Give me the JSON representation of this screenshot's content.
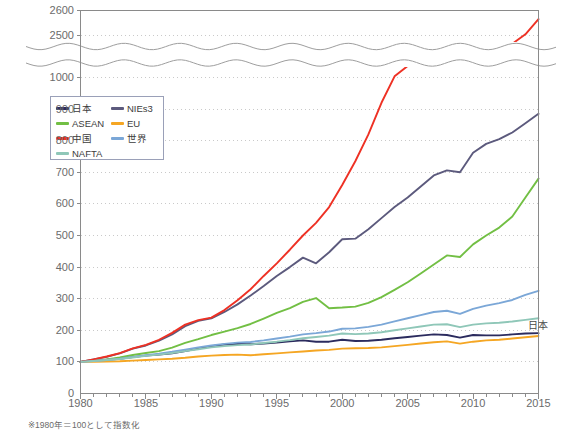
{
  "chart_data": {
    "type": "line",
    "title": "",
    "xlabel": "",
    "ylabel": "",
    "note": "※1980年＝100として指数化",
    "grid": true,
    "legend_position": "upper-left-inside",
    "axis_break": {
      "present": true,
      "below": 1100,
      "above": 2450,
      "style": "wavy"
    },
    "xlim": [
      1980,
      2015
    ],
    "xticks": [
      1980,
      1985,
      1990,
      1995,
      2000,
      2005,
      2010,
      2015
    ],
    "xtick_labels": [
      "1980",
      "1985",
      "1990",
      "1995",
      "2000",
      "2005",
      "2010",
      "2015"
    ],
    "x_minor_tick_interval": 1,
    "ylim": [
      0,
      2600
    ],
    "yticks": [
      0,
      100,
      200,
      300,
      400,
      500,
      600,
      700,
      800,
      900,
      1000,
      2500,
      2600
    ],
    "ytick_labels": [
      "0",
      "100",
      "200",
      "300",
      "400",
      "500",
      "600",
      "700",
      "800",
      "900",
      "1000",
      "2500",
      "2600"
    ],
    "x": [
      1980,
      1981,
      1982,
      1983,
      1984,
      1985,
      1986,
      1987,
      1988,
      1989,
      1990,
      1991,
      1992,
      1993,
      1994,
      1995,
      1996,
      1997,
      1998,
      1999,
      2000,
      2001,
      2002,
      2003,
      2004,
      2005,
      2006,
      2007,
      2008,
      2009,
      2010,
      2011,
      2012,
      2013,
      2014,
      2015
    ],
    "annotations": [
      {
        "text": "日本",
        "x": 2014.2,
        "y": 193
      }
    ],
    "series": [
      {
        "name": "日本",
        "color": "#2b2b5e",
        "values": [
          100,
          104,
          107,
          110,
          115,
          120,
          123,
          127,
          134,
          142,
          150,
          155,
          157,
          156,
          158,
          161,
          165,
          168,
          164,
          164,
          170,
          166,
          167,
          170,
          175,
          179,
          183,
          187,
          185,
          177,
          185,
          184,
          184,
          187,
          190,
          191
        ]
      },
      {
        "name": "NIEs3",
        "color": "#5c5a7d",
        "values": [
          100,
          108,
          116,
          127,
          142,
          152,
          167,
          187,
          213,
          230,
          238,
          258,
          282,
          310,
          340,
          372,
          400,
          430,
          412,
          447,
          488,
          490,
          520,
          555,
          590,
          620,
          655,
          690,
          706,
          700,
          762,
          790,
          805,
          826,
          855,
          885
        ]
      },
      {
        "name": "ASEAN",
        "color": "#72bf44",
        "values": [
          100,
          104,
          108,
          114,
          122,
          128,
          134,
          145,
          160,
          172,
          185,
          196,
          207,
          220,
          237,
          255,
          270,
          290,
          302,
          270,
          272,
          275,
          287,
          305,
          328,
          352,
          380,
          408,
          437,
          432,
          472,
          500,
          525,
          560,
          620,
          680
        ]
      },
      {
        "name": "EU",
        "color": "#f5a623",
        "values": [
          100,
          100,
          101,
          102,
          104,
          106,
          108,
          110,
          113,
          117,
          120,
          122,
          123,
          121,
          124,
          127,
          130,
          133,
          136,
          138,
          142,
          143,
          144,
          146,
          150,
          154,
          158,
          162,
          165,
          158,
          164,
          168,
          170,
          174,
          178,
          182
        ]
      },
      {
        "name": "中国",
        "color": "#ee3124",
        "values": [
          100,
          108,
          117,
          128,
          143,
          154,
          170,
          192,
          218,
          232,
          240,
          264,
          295,
          330,
          372,
          412,
          455,
          500,
          540,
          590,
          660,
          735,
          820,
          920,
          1010,
          1100,
          1290,
          1480,
          1680,
          1700,
          1980,
          2180,
          2290,
          2400,
          2490,
          2560
        ]
      },
      {
        "name": "世界",
        "color": "#7ba7d7",
        "values": [
          100,
          103,
          106,
          110,
          116,
          121,
          126,
          132,
          139,
          146,
          152,
          157,
          161,
          163,
          168,
          174,
          180,
          187,
          191,
          196,
          205,
          206,
          211,
          218,
          228,
          238,
          248,
          258,
          262,
          252,
          268,
          278,
          286,
          296,
          312,
          325
        ]
      },
      {
        "name": "NAFTA",
        "color": "#8fc7b8",
        "values": [
          100,
          103,
          106,
          109,
          114,
          119,
          123,
          128,
          134,
          140,
          146,
          150,
          153,
          155,
          160,
          164,
          169,
          175,
          179,
          183,
          190,
          188,
          190,
          194,
          200,
          206,
          212,
          218,
          219,
          210,
          218,
          222,
          224,
          228,
          233,
          238
        ]
      }
    ]
  },
  "legend": {
    "items": [
      {
        "label": "日本",
        "color": "#2b2b5e"
      },
      {
        "label": "NIEs3",
        "color": "#5c5a7d"
      },
      {
        "label": "ASEAN",
        "color": "#72bf44"
      },
      {
        "label": "EU",
        "color": "#f5a623"
      },
      {
        "label": "中国",
        "color": "#ee3124"
      },
      {
        "label": "世界",
        "color": "#7ba7d7"
      },
      {
        "label": "NAFTA",
        "color": "#8fc7b8"
      }
    ]
  },
  "colors": {
    "grid": "#c9c9c9",
    "axis": "#8a8a8a",
    "text": "#6b6b6b",
    "plot_background": "#ffffff"
  }
}
